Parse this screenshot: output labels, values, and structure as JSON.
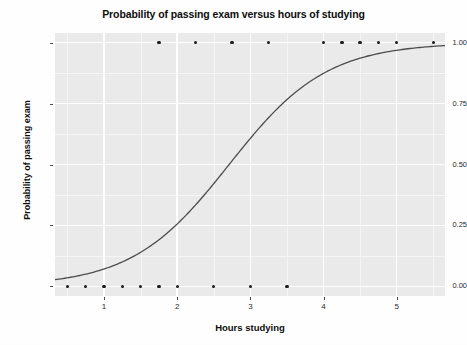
{
  "chart_data": {
    "type": "line",
    "title": "Probability of passing exam versus hours of studying",
    "xlabel": "Hours studying",
    "ylabel": "Probability of passing exam",
    "xlim": [
      0.33,
      5.66
    ],
    "ylim": [
      -0.04,
      1.04
    ],
    "grid": true,
    "legend": "none",
    "panel_background": "#ebebeb",
    "gridline_color": "#ffffff",
    "curve_color": "#4d4d4d",
    "point_color": "#1a1a1a",
    "xticks": [
      1,
      2,
      3,
      4,
      5
    ],
    "xtick_labels": [
      "1",
      "2",
      "3",
      "4",
      "5"
    ],
    "yticks": [
      0.0,
      0.25,
      0.5,
      0.75,
      1.0
    ],
    "ytick_labels": [
      "0.00",
      "0.25",
      "0.50",
      "0.75",
      "1.00"
    ],
    "series": [
      {
        "name": "observations",
        "type": "scatter",
        "x": [
          0.5,
          0.75,
          1.0,
          1.25,
          1.5,
          1.75,
          1.75,
          2.0,
          2.25,
          2.5,
          2.75,
          3.0,
          3.25,
          3.5,
          4.0,
          4.25,
          4.5,
          4.75,
          5.0,
          5.5
        ],
        "y": [
          0,
          0,
          0,
          0,
          0,
          0,
          1,
          0,
          1,
          0,
          1,
          0,
          1,
          0,
          1,
          1,
          1,
          1,
          1,
          1
        ]
      },
      {
        "name": "logistic fit",
        "type": "line",
        "model": "logistic",
        "intercept": -4.0777,
        "slope": 1.5046,
        "x": [
          0.33,
          0.5,
          0.75,
          1.0,
          1.25,
          1.5,
          1.75,
          2.0,
          2.25,
          2.5,
          2.75,
          3.0,
          3.25,
          3.5,
          3.75,
          4.0,
          4.25,
          4.5,
          4.75,
          5.0,
          5.25,
          5.5,
          5.66
        ],
        "y": [
          0.029,
          0.036,
          0.052,
          0.074,
          0.104,
          0.145,
          0.199,
          0.268,
          0.351,
          0.446,
          0.545,
          0.641,
          0.727,
          0.798,
          0.854,
          0.897,
          0.928,
          0.951,
          0.967,
          0.978,
          0.985,
          0.99,
          0.992
        ]
      }
    ]
  },
  "axes": {
    "x_label_text": "Hours studying",
    "y_label_text": "Probability of passing exam"
  }
}
